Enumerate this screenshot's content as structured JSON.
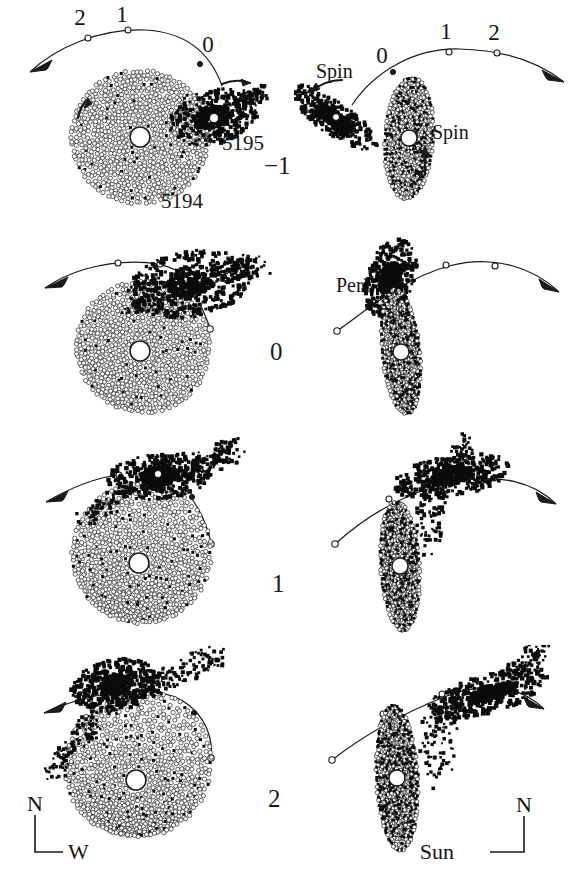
{
  "figure": {
    "caption_visible": false,
    "background_color": "#ffffff",
    "ink_color": "#1a1a1a",
    "rows": 4,
    "columns": 2,
    "column_views": [
      "sky-plane view",
      "edge-on view"
    ],
    "row_time_labels": [
      "-1",
      "0",
      "1",
      "2"
    ]
  },
  "chart_data": {
    "type": "scatter",
    "title": "",
    "subtitle": "",
    "xlabel": "",
    "ylabel": "",
    "grid": false,
    "legend_position": "none",
    "series": [
      {
        "name": "NGC 5194 disk particles",
        "marker": "open-circle",
        "color": "#333333"
      },
      {
        "name": "NGC 5195 companion particles",
        "marker": "filled-square",
        "color": "#000000"
      },
      {
        "name": "companion orbit track",
        "marker": "line",
        "color": "#1a1a1a"
      }
    ],
    "panels": [
      {
        "row": 0,
        "time_label": "-1",
        "column": 0,
        "view": "sky",
        "orbit_tick_labels": [
          "2",
          "1",
          "0"
        ],
        "orbit_arrow_direction": "left",
        "galaxy_labels": [
          "5194",
          "5195"
        ],
        "annotations": []
      },
      {
        "row": 0,
        "time_label": "-1",
        "column": 1,
        "view": "edge-on",
        "orbit_tick_labels": [
          "0",
          "1",
          "2"
        ],
        "orbit_arrow_direction": "right",
        "galaxy_labels": [],
        "annotations": [
          "Spin",
          "Spin"
        ]
      },
      {
        "row": 1,
        "time_label": "0",
        "column": 0,
        "view": "sky",
        "orbit_tick_labels": [],
        "orbit_arrow_direction": "left",
        "galaxy_labels": [],
        "annotations": []
      },
      {
        "row": 1,
        "time_label": "0",
        "column": 1,
        "view": "edge-on",
        "orbit_tick_labels": [],
        "orbit_arrow_direction": "right",
        "galaxy_labels": [],
        "annotations": [
          "Peri"
        ]
      },
      {
        "row": 2,
        "time_label": "1",
        "column": 0,
        "view": "sky",
        "orbit_tick_labels": [],
        "orbit_arrow_direction": "left",
        "galaxy_labels": [],
        "annotations": []
      },
      {
        "row": 2,
        "time_label": "1",
        "column": 1,
        "view": "edge-on",
        "orbit_tick_labels": [],
        "orbit_arrow_direction": "right",
        "galaxy_labels": [],
        "annotations": []
      },
      {
        "row": 3,
        "time_label": "2",
        "column": 0,
        "view": "sky",
        "orbit_tick_labels": [],
        "orbit_arrow_direction": "left",
        "galaxy_labels": [],
        "annotations": [],
        "compass": {
          "up": "N",
          "side": "W"
        }
      },
      {
        "row": 3,
        "time_label": "2",
        "column": 1,
        "view": "edge-on",
        "orbit_tick_labels": [],
        "orbit_arrow_direction": "right",
        "galaxy_labels": [],
        "annotations": [],
        "compass": {
          "up": "N",
          "side": "Sun"
        }
      }
    ]
  },
  "labels": {
    "row_minus_one": "−1",
    "row_zero": "0",
    "row_one": "1",
    "row_two": "2",
    "galaxy_main": "5194",
    "galaxy_companion": "5195",
    "spin_companion": "Spin",
    "spin_primary": "Spin",
    "pericenter": "Peri",
    "orbit_tick_0": "0",
    "orbit_tick_1": "1",
    "orbit_tick_2": "2",
    "compass_north_left": "N",
    "compass_west_left": "W",
    "compass_north_right": "N",
    "compass_sun_right": "Sun"
  }
}
